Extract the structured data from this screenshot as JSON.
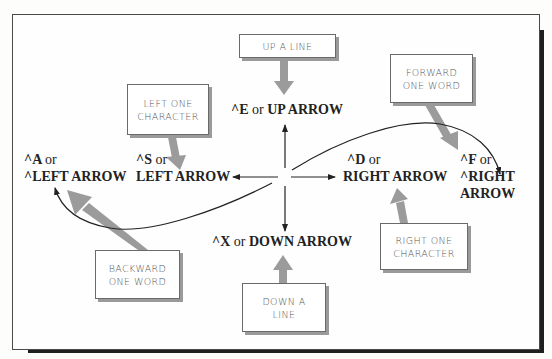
{
  "diagram": {
    "center_keys": {
      "up": {
        "prefix": "^E",
        "or": "or",
        "label": "UP ARROW"
      },
      "down": {
        "prefix": "^X",
        "or": "or",
        "label": "DOWN ARROW"
      },
      "left": {
        "line1_prefix": "^S",
        "line1_or": "or",
        "line2": "LEFT ARROW"
      },
      "right": {
        "line1_prefix": "^D",
        "line1_or": "or",
        "line2": "RIGHT ARROW"
      },
      "word_left": {
        "line1_prefix": "^A",
        "line1_or": "or",
        "line2": "^LEFT ARROW"
      },
      "word_right": {
        "line1_prefix": "^F",
        "line1_or": "or",
        "line2": "^RIGHT",
        "line3": "ARROW"
      }
    },
    "callouts": {
      "up_a_line": {
        "line1": "UP A LINE"
      },
      "left_one_character": {
        "line1": "LEFT ONE",
        "line2": "CHARACTER"
      },
      "forward_one_word": {
        "line1": "FORWARD",
        "line2": "ONE WORD"
      },
      "right_one_character": {
        "line1": "RIGHT ONE",
        "line2": "CHARACTER"
      },
      "backward_one_word": {
        "line1": "BACKWARD",
        "line2": "ONE WORD"
      },
      "down_a_line": {
        "line1": "DOWN A",
        "line2": "LINE"
      }
    },
    "colors": {
      "frame": "#4a4a4a",
      "shadow": "#1f1f1f",
      "pointer_arrow": "#9b9b9b",
      "text": "#222222",
      "callout_text": "#555555"
    }
  }
}
